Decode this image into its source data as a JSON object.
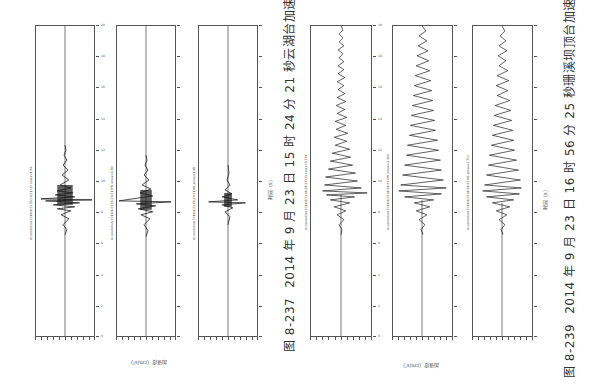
{
  "figures": [
    {
      "id": "fig-8-237",
      "caption_number": "图 8-237",
      "caption_text": "2014 年 9 月 23 日 15 时 24 分 21 秒云湖台加速度记录",
      "time_axis_label": "时间（s）",
      "accel_axis_label": "加速度（cm/s²）",
      "panels": [
        {
          "title": "Acceleration 2014/9/23 15:24:21 UD amax=1.46",
          "component": "UD",
          "waveform": "impulsive"
        },
        {
          "title": "Acceleration 2014/9/23 15:24:21 EW amax=1.80",
          "component": "EW",
          "waveform": "impulsive"
        },
        {
          "title": "Acceleration 2014/9/23 15:24:21 NS amax=1.48",
          "component": "NS",
          "waveform": "impulsive"
        }
      ],
      "time_ticks": [
        "0",
        "2",
        "4",
        "6",
        "8",
        "10",
        "12",
        "14",
        "16",
        "18",
        "20"
      ],
      "accel_ticks": [
        "-2.0",
        "-1.6",
        "-1.2",
        "-0.8",
        "-0.4",
        "0",
        "0.4",
        "0.8",
        "1.2",
        "1.6",
        "2.0"
      ]
    },
    {
      "id": "fig-8-239",
      "caption_number": "图 8-239",
      "caption_text": "2014 年 9 月 23 日 16 时 56 分 25 秒珊溪坝顶台加速度记录",
      "time_axis_label": "时间（s）",
      "accel_axis_label": "加速度（cm/s²）",
      "panels": [
        {
          "title": "Acceleration 2014/9/23 16:56:25 UD amax=3.778",
          "component": "UD",
          "waveform": "long"
        },
        {
          "title": "Acceleration 2014/9/23 16:56:25 EW amax=3.343",
          "component": "EW",
          "waveform": "long"
        },
        {
          "title": "Acceleration 2014/9/23 16:56:25 NS amax=2.722",
          "component": "NS",
          "waveform": "long"
        }
      ],
      "time_ticks": [
        "0",
        "2",
        "4",
        "6",
        "8",
        "10",
        "12",
        "14",
        "16",
        "18",
        "20"
      ],
      "accel_ticks": [
        "-4",
        "-3.2",
        "-2.4",
        "-1.6",
        "-0.8",
        "0",
        "0.8",
        "1.6",
        "2.4",
        "3.2",
        "4"
      ]
    }
  ],
  "colors": {
    "trace": "#1a1a1a",
    "frame": "#555555",
    "caption": "#333333"
  }
}
